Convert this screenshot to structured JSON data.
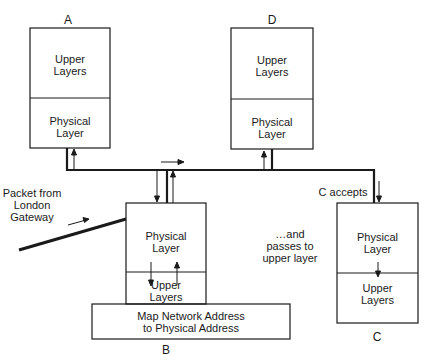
{
  "nodes": {
    "A": {
      "label": "A",
      "upper": [
        "Upper",
        "Layers"
      ],
      "physical": [
        "Physical",
        "Layer"
      ]
    },
    "D": {
      "label": "D",
      "upper": [
        "Upper",
        "Layers"
      ],
      "physical": [
        "Physical",
        "Layer"
      ]
    },
    "B": {
      "label": "B",
      "physical": [
        "Physical",
        "Layer"
      ],
      "upper": [
        "Upper",
        "Layers"
      ],
      "map": [
        "Map Network Address",
        "to Physical Address"
      ]
    },
    "C": {
      "label": "C",
      "physical": [
        "Physical",
        "Layer"
      ],
      "upper": [
        "Upper",
        "Layers"
      ]
    }
  },
  "annotations": {
    "packet": [
      "Packet from",
      "London",
      "Gateway"
    ],
    "c_accepts": "C accepts",
    "passes": [
      "…and",
      "passes to",
      "upper layer"
    ]
  },
  "colors": {
    "line": "#1a1a1a",
    "background": "#ffffff"
  }
}
